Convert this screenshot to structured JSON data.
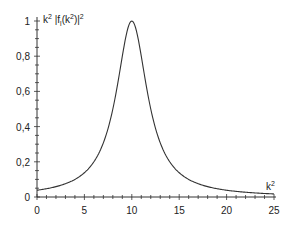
{
  "chart_data": {
    "type": "line",
    "title": "",
    "xlabel": "k²",
    "ylabel": "k² |f_l(k²)|²",
    "ylabel_parts": {
      "main": "k",
      "sup1": "2",
      "bar_open": "|",
      "f": "f",
      "sub": "l",
      "arg_open": "(k",
      "sup2": "2",
      "arg_close": ")",
      "bar_close": "|",
      "sup3": "2"
    },
    "xlim": [
      0,
      25
    ],
    "ylim": [
      0,
      1
    ],
    "grid": false,
    "legend": null,
    "x_ticks": [
      0,
      5,
      10,
      15,
      20,
      25
    ],
    "x_tick_labels": [
      "0",
      "5",
      "10",
      "15",
      "20",
      "25"
    ],
    "y_ticks": [
      0,
      0.2,
      0.4,
      0.6,
      0.8,
      1
    ],
    "y_tick_labels": [
      "0",
      "0,2",
      "0,4",
      "0,6",
      "0,8",
      "1"
    ],
    "series": [
      {
        "name": "resonance",
        "x": [
          0,
          1,
          2,
          3,
          4,
          5,
          6,
          7,
          8,
          9,
          9.5,
          10,
          10.5,
          11,
          12,
          13,
          14,
          15,
          16,
          17,
          18,
          19,
          20,
          21,
          22,
          23,
          24,
          25
        ],
        "y": [
          0.038,
          0.047,
          0.059,
          0.075,
          0.1,
          0.138,
          0.2,
          0.308,
          0.5,
          0.8,
          0.941,
          1.0,
          0.941,
          0.8,
          0.5,
          0.308,
          0.2,
          0.138,
          0.1,
          0.075,
          0.059,
          0.047,
          0.038,
          0.032,
          0.027,
          0.023,
          0.02,
          0.017
        ]
      }
    ],
    "annotations": []
  }
}
